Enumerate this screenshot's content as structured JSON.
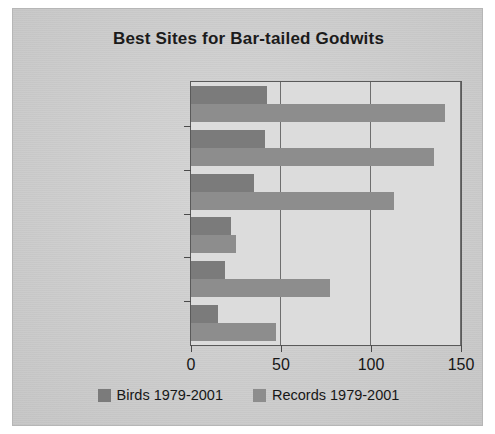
{
  "chart_data": {
    "type": "bar",
    "orientation": "horizontal",
    "title": "Best Sites for Bar-tailed Godwits",
    "xlabel": "",
    "ylabel": "",
    "categories": [
      "Belvide Reservoir",
      "Blithfield Reservoir",
      "Draycote Water",
      "Kingsbury W P",
      "Chasewater",
      "Upton Warren"
    ],
    "series": [
      {
        "name": "Birds 1979-2001",
        "color": "#7b7b7b",
        "values": [
          42,
          41,
          35,
          22,
          19,
          15
        ]
      },
      {
        "name": "Records 1979-2001",
        "color": "#8d8d8d",
        "values": [
          141,
          135,
          113,
          25,
          77,
          47
        ]
      }
    ],
    "xlim": [
      0,
      150
    ],
    "xticks": [
      0,
      50,
      100,
      150
    ],
    "xtick_labels": [
      "0",
      "50",
      "100",
      "150"
    ],
    "grid": true,
    "grid_axis": "x",
    "legend_position": "bottom",
    "plot_background": "#dcdcdc",
    "figure_background": "#d2d2d2",
    "axis_color": "#5a5a5a"
  }
}
